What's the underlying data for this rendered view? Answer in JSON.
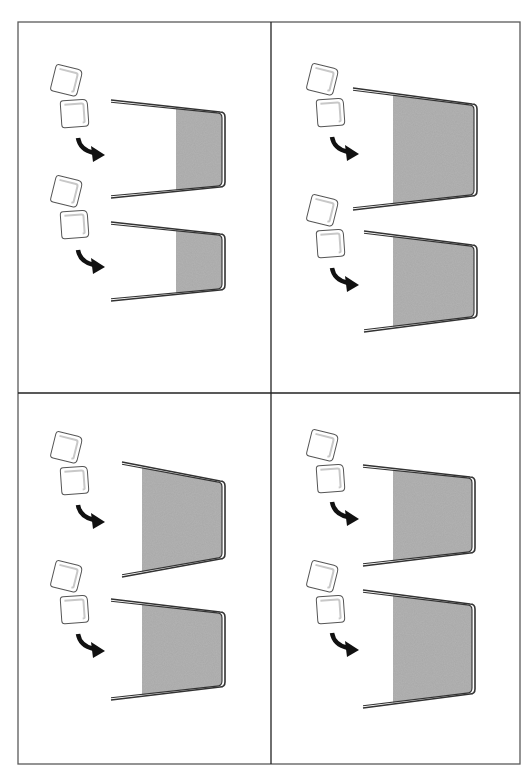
{
  "diagram": {
    "colors": {
      "background": "#ffffff",
      "frame": "#5a5a5a",
      "glass_outline": "#333333",
      "water": "#a9a9a9",
      "ice_outline": "#555555",
      "ice_inner": "#c8c8c8",
      "arrow": "#111111"
    },
    "frame": {
      "x": 18,
      "y": 22,
      "width": 502,
      "height": 742,
      "divider_x": 271,
      "divider_y": 393
    },
    "panels": [
      {
        "id": "top-left",
        "glasses": [
          {
            "rim_top": [
              111,
              100
            ],
            "base_top": [
              225,
              112
            ],
            "base_bottom": [
              225,
              187
            ],
            "rim_bottom": [
              111,
              198
            ],
            "water_start_x": 176
          },
          {
            "rim_top": [
              111,
              222
            ],
            "base_top": [
              225,
              234
            ],
            "base_bottom": [
              225,
              290
            ],
            "rim_bottom": [
              111,
              301
            ],
            "water_start_x": 176
          }
        ],
        "ice_pairs": [
          {
            "x": 53,
            "y": 66
          },
          {
            "x": 53,
            "y": 177
          }
        ],
        "arrows": [
          {
            "x": 76,
            "y": 138
          },
          {
            "x": 76,
            "y": 250
          }
        ]
      },
      {
        "id": "top-right",
        "glasses": [
          {
            "rim_top": [
              353,
              88
            ],
            "base_top": [
              477,
              104
            ],
            "base_bottom": [
              477,
              196
            ],
            "rim_bottom": [
              353,
              210
            ],
            "water_start_x": 393
          },
          {
            "rim_top": [
              364,
              231
            ],
            "base_top": [
              477,
              245
            ],
            "base_bottom": [
              477,
              318
            ],
            "rim_bottom": [
              364,
              332
            ],
            "water_start_x": 393
          }
        ],
        "ice_pairs": [
          {
            "x": 309,
            "y": 65
          },
          {
            "x": 309,
            "y": 196
          }
        ],
        "arrows": [
          {
            "x": 330,
            "y": 137
          },
          {
            "x": 330,
            "y": 268
          }
        ]
      },
      {
        "id": "bottom-left",
        "glasses": [
          {
            "rim_top": [
              122,
              462
            ],
            "base_top": [
              225,
              481
            ],
            "base_bottom": [
              225,
              559
            ],
            "rim_bottom": [
              122,
              577
            ],
            "water_start_x": 142
          },
          {
            "rim_top": [
              111,
              599
            ],
            "base_top": [
              225,
              612
            ],
            "base_bottom": [
              225,
              687
            ],
            "rim_bottom": [
              111,
              700
            ],
            "water_start_x": 142
          }
        ],
        "ice_pairs": [
          {
            "x": 53,
            "y": 433
          },
          {
            "x": 53,
            "y": 562
          }
        ],
        "arrows": [
          {
            "x": 76,
            "y": 505
          },
          {
            "x": 76,
            "y": 634
          }
        ]
      },
      {
        "id": "bottom-right",
        "glasses": [
          {
            "rim_top": [
              363,
              465
            ],
            "base_top": [
              475,
              477
            ],
            "base_bottom": [
              475,
              553
            ],
            "rim_bottom": [
              363,
              566
            ],
            "water_start_x": 393
          },
          {
            "rim_top": [
              363,
              590
            ],
            "base_top": [
              475,
              604
            ],
            "base_bottom": [
              475,
              694
            ],
            "rim_bottom": [
              363,
              708
            ],
            "water_start_x": 393
          }
        ],
        "ice_pairs": [
          {
            "x": 309,
            "y": 431
          },
          {
            "x": 309,
            "y": 562
          }
        ],
        "arrows": [
          {
            "x": 330,
            "y": 502
          },
          {
            "x": 330,
            "y": 633
          }
        ]
      }
    ]
  }
}
